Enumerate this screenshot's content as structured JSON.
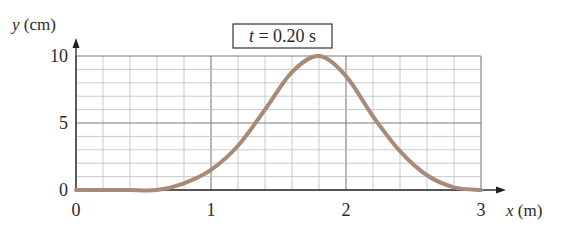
{
  "chart_data": {
    "type": "line",
    "title": "t = 0.20 s",
    "time_label": {
      "var": "t",
      "text": " = 0.20 s"
    },
    "xlabel": "x (m)",
    "xlabel_var": "x",
    "xlabel_unit": " (m)",
    "ylabel": "y (cm)",
    "ylabel_var": "y",
    "ylabel_unit": " (cm)",
    "xlim": [
      0,
      3
    ],
    "ylim": [
      0,
      10
    ],
    "x_ticks": [
      "0",
      "1",
      "2",
      "3"
    ],
    "y_ticks": [
      "0",
      "5",
      "10"
    ],
    "grid": true,
    "grid_minor_x_step": 0.2,
    "grid_minor_y_step": 1,
    "legend": null,
    "series": [
      {
        "name": "wave pulse",
        "color": "#a88a78",
        "x": [
          0,
          0.2,
          0.4,
          0.6,
          0.8,
          1.0,
          1.2,
          1.4,
          1.6,
          1.8,
          2.0,
          2.2,
          2.4,
          2.6,
          2.8,
          3.0
        ],
        "y": [
          0,
          0,
          0,
          0,
          0.5,
          1.5,
          3.3,
          6.0,
          8.8,
          10,
          8.5,
          5.5,
          2.9,
          1.1,
          0.2,
          0
        ]
      }
    ]
  }
}
